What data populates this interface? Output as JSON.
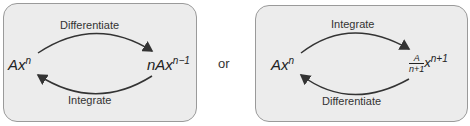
{
  "panels": [
    {
      "left_expr": {
        "base": "Ax",
        "exp": "n"
      },
      "right_expr": {
        "base": "nAx",
        "exp": "n−1"
      },
      "top_label": "Differentiate",
      "bottom_label": "Integrate"
    },
    {
      "left_expr": {
        "base": "Ax",
        "exp": "n"
      },
      "right_expr": {
        "frac_num": "A",
        "frac_den": "n+1",
        "base": "x",
        "exp": "n+1"
      },
      "top_label": "Integrate",
      "bottom_label": "Differentiate"
    }
  ],
  "separator": "or"
}
